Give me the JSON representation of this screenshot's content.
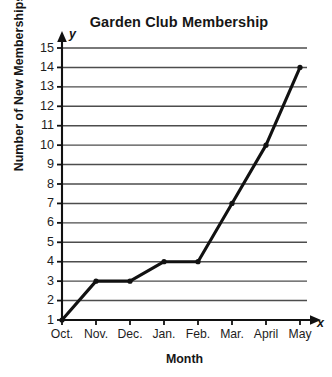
{
  "chart_data": {
    "type": "line",
    "title": "Garden Club Membership",
    "xlabel": "Month",
    "ylabel": "Number of New Memberships",
    "categories": [
      "Oct.",
      "Nov.",
      "Dec.",
      "Jan.",
      "Feb.",
      "Mar.",
      "April",
      "May"
    ],
    "values": [
      1,
      3,
      3,
      4,
      4,
      7,
      10,
      14
    ],
    "series": [
      {
        "name": "New Memberships",
        "values": [
          1,
          3,
          3,
          4,
          4,
          7,
          10,
          14
        ]
      }
    ],
    "points": [
      {
        "x": "Oct.",
        "y": 1
      },
      {
        "x": "Nov.",
        "y": 3
      },
      {
        "x": "Dec.",
        "y": 3
      },
      {
        "x": "Jan.",
        "y": 4
      },
      {
        "x": "Feb.",
        "y": 4
      },
      {
        "x": "Mar.",
        "y": 7
      },
      {
        "x": "April",
        "y": 10
      },
      {
        "x": "May",
        "y": 14
      }
    ],
    "ylim": [
      1,
      15
    ],
    "ytick_labels": [
      "15",
      "14",
      "13",
      "12",
      "11",
      "10",
      "9",
      "8",
      "7",
      "6",
      "5",
      "4",
      "3",
      "2",
      "1"
    ],
    "ytick_values": [
      15,
      14,
      13,
      12,
      11,
      10,
      9,
      8,
      7,
      6,
      5,
      4,
      3,
      2,
      1
    ],
    "grid": true,
    "grid_orientation": "horizontal",
    "legend": false,
    "legend_position": "none",
    "axis_letters": {
      "x": "x",
      "y": "y"
    },
    "marker": "dot",
    "line_color": "#111111",
    "grid_color": "#4d4d4d",
    "axis_color": "#111111",
    "background_color": "#ffffff"
  }
}
